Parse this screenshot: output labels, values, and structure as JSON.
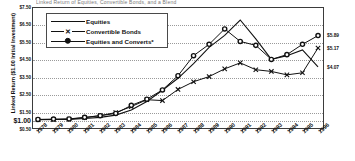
{
  "chart_data": {
    "type": "line",
    "title": "Linked Return of Equities, Convertible Bonds, and a Blend",
    "xlabel": "",
    "ylabel": "Linked Return ($1.00 Initial Investment)",
    "ylim": [
      0.5,
      7.5
    ],
    "ytick_labels": [
      "$7.50",
      "$6.50",
      "$5.50",
      "$4.50",
      "$3.50",
      "$2.50",
      "$1.50",
      "$1.00",
      "$0.50"
    ],
    "ytick_values": [
      7.5,
      6.5,
      5.5,
      4.5,
      3.5,
      2.5,
      1.5,
      1.0,
      0.5
    ],
    "grid": true,
    "legend_position": "top-left",
    "categories": [
      "1978",
      "1979",
      "1980",
      "1981",
      "1982",
      "1983",
      "1984",
      "1985",
      "1986",
      "1987",
      "1988",
      "1989",
      "1990",
      "1991",
      "1992",
      "1993",
      "1994",
      "1995",
      "1996"
    ],
    "series": [
      {
        "name": "Equities",
        "marker": "none",
        "values": [
          1.0,
          1.0,
          1.0,
          1.05,
          1.12,
          1.25,
          1.55,
          2.05,
          2.7,
          3.4,
          4.25,
          5.2,
          5.9,
          6.8,
          5.7,
          4.5,
          4.72,
          5.05,
          4.07
        ]
      },
      {
        "name": "Convertible Bonds",
        "marker": "x",
        "values": [
          0.98,
          0.99,
          1.02,
          1.1,
          1.22,
          1.4,
          1.75,
          2.15,
          2.1,
          2.75,
          3.2,
          3.5,
          3.95,
          4.3,
          3.9,
          3.8,
          3.6,
          3.72,
          5.17
        ]
      },
      {
        "name": "Equities and Converts*",
        "marker": "circle",
        "values": [
          1.0,
          1.02,
          1.03,
          1.12,
          1.22,
          1.35,
          1.82,
          2.18,
          2.72,
          3.55,
          4.72,
          5.38,
          6.28,
          5.55,
          5.32,
          4.5,
          4.78,
          5.38,
          5.89
        ]
      }
    ],
    "end_labels": [
      {
        "series": "Equities and Converts*",
        "text": "$5.89",
        "value": 5.89
      },
      {
        "series": "Convertible Bonds",
        "text": "$5.17",
        "value": 5.17
      },
      {
        "series": "Equities",
        "text": "$4.07",
        "value": 4.07
      }
    ]
  },
  "legend": {
    "items": [
      {
        "label": "Equities",
        "marker": "line"
      },
      {
        "label": "Convertible Bonds",
        "marker": "x"
      },
      {
        "label": "Equities and Converts*",
        "marker": "circle"
      }
    ]
  },
  "colors": {
    "series_line": "#111111",
    "axis": "#3b3b3b",
    "grid": "#9a9a9a",
    "background": "#ffffff"
  }
}
